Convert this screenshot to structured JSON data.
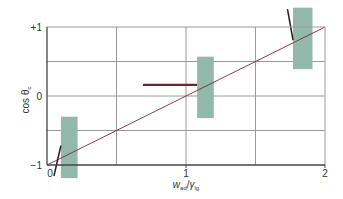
{
  "chart_data": {
    "type": "line",
    "title": "",
    "xlabel": {
      "main": "w",
      "sub1": "ad",
      "sep": "/",
      "main2": "γ",
      "sub2": "lg"
    },
    "ylabel": {
      "main": "cos θ",
      "sub": "c"
    },
    "xlim": [
      0,
      2
    ],
    "ylim": [
      -1,
      1
    ],
    "grid": true,
    "x_ticks": [
      {
        "value": 0,
        "label": "0"
      },
      {
        "value": 1,
        "label": "1"
      },
      {
        "value": 2,
        "label": "2"
      }
    ],
    "y_ticks": [
      {
        "value": 1,
        "label": "+1"
      },
      {
        "value": 0,
        "label": "0"
      },
      {
        "value": -1,
        "label": "−1"
      }
    ],
    "x_gridlines": [
      0.5,
      1,
      1.5
    ],
    "y_gridlines": [
      -0.5,
      0,
      0.5
    ],
    "reference_line": {
      "name": "diagonal",
      "x": [
        0,
        2
      ],
      "y": [
        -1,
        1
      ],
      "color": "#7a2a35"
    },
    "bands": [
      {
        "name": "band-1",
        "x": [
          0.1,
          0.22
        ],
        "y": [
          -1.19,
          -0.3
        ],
        "color": "#93b8ac"
      },
      {
        "name": "band-2",
        "x": [
          1.08,
          1.2
        ],
        "y": [
          -0.32,
          0.57
        ],
        "color": "#93b8ac"
      },
      {
        "name": "band-3",
        "x": [
          1.77,
          1.91
        ],
        "y": [
          0.39,
          1.28
        ],
        "color": "#93b8ac"
      }
    ],
    "segments": [
      {
        "name": "plateau-segment",
        "x": [
          0.69,
          1.08
        ],
        "y": [
          0.16,
          0.16
        ],
        "color": "#6e2230",
        "width": "thick"
      },
      {
        "name": "steep-segment-low",
        "x": [
          0.05,
          0.1
        ],
        "y": [
          -1.16,
          -0.72
        ],
        "color": "#2a1a1c",
        "width": "medium"
      },
      {
        "name": "steep-segment-high",
        "x": [
          1.73,
          1.77
        ],
        "y": [
          1.26,
          0.81
        ],
        "color": "#2a1a1c",
        "width": "medium"
      }
    ]
  }
}
